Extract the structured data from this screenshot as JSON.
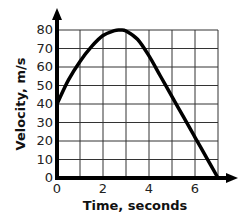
{
  "chart_data": {
    "type": "line",
    "title": "",
    "xlabel": "Time, seconds",
    "ylabel": "Velocity, m/s",
    "xlim": [
      0,
      7
    ],
    "ylim": [
      0,
      80
    ],
    "grid": true,
    "x_ticks": [
      "0",
      "2",
      "4",
      "6"
    ],
    "y_ticks": [
      "0",
      "10",
      "20",
      "30",
      "40",
      "50",
      "60",
      "70",
      "80"
    ],
    "series": [
      {
        "name": "velocity",
        "x": [
          0,
          0.5,
          1,
          1.5,
          2,
          2.5,
          2.75,
          3,
          3.5,
          4,
          4.5,
          5,
          5.5,
          6,
          6.5,
          7
        ],
        "values": [
          40,
          53,
          63,
          71,
          77,
          79.7,
          80,
          79.5,
          75,
          66,
          55,
          44,
          33,
          22,
          11,
          0
        ]
      }
    ]
  }
}
